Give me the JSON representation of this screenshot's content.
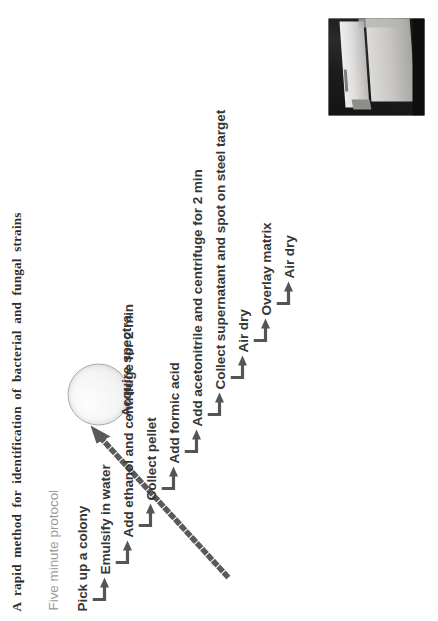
{
  "figure": {
    "title": "A rapid method for identification of bacterial and fungal strains",
    "subtitle": "Five minute protocol",
    "colors": {
      "title_text": "#2b2b2b",
      "subtitle_text": "#9a9a9a",
      "step_text": "#363636",
      "arrow": "#555555",
      "dotted_arrow": "#5a5a5a",
      "dish_fill": "#f4f4f4",
      "dish_border": "#a9a9a9"
    },
    "steps": [
      {
        "label": "Pick up a colony"
      },
      {
        "label": "Emulsify in water"
      },
      {
        "label": "Add ethanol and centrifuge for 2 min"
      },
      {
        "label": "Collect pellet"
      },
      {
        "label": "Add formic acid"
      },
      {
        "label": "Add acetonitrile and centrifuge for 2 min"
      },
      {
        "label": "Collect supernatant and spot on steel target"
      },
      {
        "label": "Air dry"
      },
      {
        "label": "Overlay matrix"
      },
      {
        "label": "Air dry"
      }
    ],
    "final_step": {
      "label": "Acquire spectra"
    },
    "photo": {
      "caption": "maldi-steel-target-plate-photo"
    },
    "dish": {
      "caption": "agar-plate-colony"
    },
    "rotation_degrees": -90
  }
}
